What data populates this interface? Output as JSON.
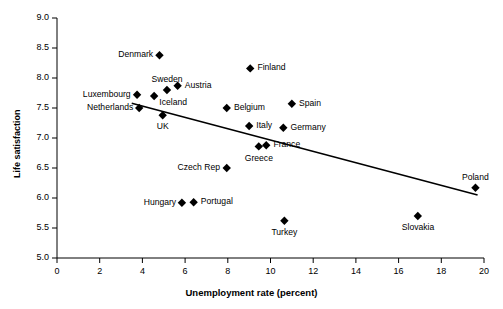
{
  "chart_data": {
    "type": "scatter",
    "title": "",
    "xlabel": "Unemployment rate (percent)",
    "ylabel": "Life satisfaction",
    "xlim": [
      0,
      20
    ],
    "ylim": [
      5.0,
      9.0
    ],
    "xticks": [
      0,
      2,
      4,
      6,
      8,
      10,
      12,
      14,
      16,
      18,
      20
    ],
    "xtick_labels": [
      "0",
      "2",
      "4",
      "6",
      "8",
      "10",
      "12",
      "14",
      "16",
      "18",
      "20"
    ],
    "yticks": [
      5.0,
      5.5,
      6.0,
      6.5,
      7.0,
      7.5,
      8.0,
      8.5,
      9.0
    ],
    "ytick_labels": [
      "5.0",
      "5.5",
      "6.0",
      "6.5",
      "7.0",
      "7.5",
      "8.0",
      "8.5",
      "9.0"
    ],
    "grid": false,
    "legend": false,
    "marker": "diamond",
    "marker_color": "#000000",
    "points": [
      {
        "label": "Denmark",
        "x": 4.8,
        "y": 8.38,
        "label_pos": "left"
      },
      {
        "label": "Finland",
        "x": 9.05,
        "y": 8.16,
        "label_pos": "right"
      },
      {
        "label": "Sweden",
        "x": 5.15,
        "y": 7.8,
        "label_pos": "above"
      },
      {
        "label": "Austria",
        "x": 5.65,
        "y": 7.87,
        "label_pos": "right"
      },
      {
        "label": "Luxembourg",
        "x": 3.75,
        "y": 7.72,
        "label_pos": "left"
      },
      {
        "label": "Iceland",
        "x": 4.55,
        "y": 7.7,
        "label_pos": "belowright"
      },
      {
        "label": "Netherlands",
        "x": 3.85,
        "y": 7.5,
        "label_pos": "left"
      },
      {
        "label": "Belgium",
        "x": 7.95,
        "y": 7.5,
        "label_pos": "right"
      },
      {
        "label": "Spain",
        "x": 11.0,
        "y": 7.57,
        "label_pos": "right"
      },
      {
        "label": "UK",
        "x": 4.95,
        "y": 7.38,
        "label_pos": "below"
      },
      {
        "label": "Italy",
        "x": 9.0,
        "y": 7.2,
        "label_pos": "right"
      },
      {
        "label": "Germany",
        "x": 10.6,
        "y": 7.17,
        "label_pos": "right"
      },
      {
        "label": "Greece",
        "x": 9.45,
        "y": 6.86,
        "label_pos": "below"
      },
      {
        "label": "France",
        "x": 9.8,
        "y": 6.88,
        "label_pos": "right"
      },
      {
        "label": "Czech Rep",
        "x": 7.95,
        "y": 6.5,
        "label_pos": "left"
      },
      {
        "label": "Poland",
        "x": 19.6,
        "y": 6.17,
        "label_pos": "above"
      },
      {
        "label": "Hungary",
        "x": 5.85,
        "y": 5.92,
        "label_pos": "left"
      },
      {
        "label": "Portugal",
        "x": 6.4,
        "y": 5.93,
        "label_pos": "right"
      },
      {
        "label": "Slovakia",
        "x": 16.9,
        "y": 5.7,
        "label_pos": "below"
      },
      {
        "label": "Turkey",
        "x": 10.65,
        "y": 5.62,
        "label_pos": "below"
      }
    ],
    "trendline": {
      "name": "linear fit",
      "x_start": 3.5,
      "y_start": 7.58,
      "x_end": 19.7,
      "y_end": 6.05,
      "color": "#000000"
    }
  }
}
